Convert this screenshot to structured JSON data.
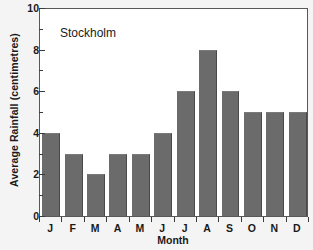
{
  "chart_data": {
    "type": "bar",
    "title": "Stockholm",
    "xlabel": "Month",
    "ylabel": "Average Rainfall (centimetres)",
    "categories": [
      "J",
      "F",
      "M",
      "A",
      "M",
      "J",
      "J",
      "A",
      "S",
      "O",
      "N",
      "D"
    ],
    "values": [
      4,
      3,
      2,
      3,
      3,
      4,
      6,
      8,
      6,
      5,
      5,
      5
    ],
    "ylim": [
      0,
      10
    ],
    "ytick_major": [
      0,
      2,
      4,
      6,
      8,
      10
    ],
    "ytick_minor": [
      1,
      3,
      5,
      7,
      9
    ],
    "ytick_labels": [
      "0",
      "2",
      "4",
      "6",
      "8",
      "10"
    ],
    "grid": false,
    "legend": false,
    "bar_color": "#6b6b6b",
    "plot_background": "#ffffff",
    "figure_background": "#f4f4f4",
    "axis_color": "#585858",
    "text_color": "#1a1a1a"
  }
}
